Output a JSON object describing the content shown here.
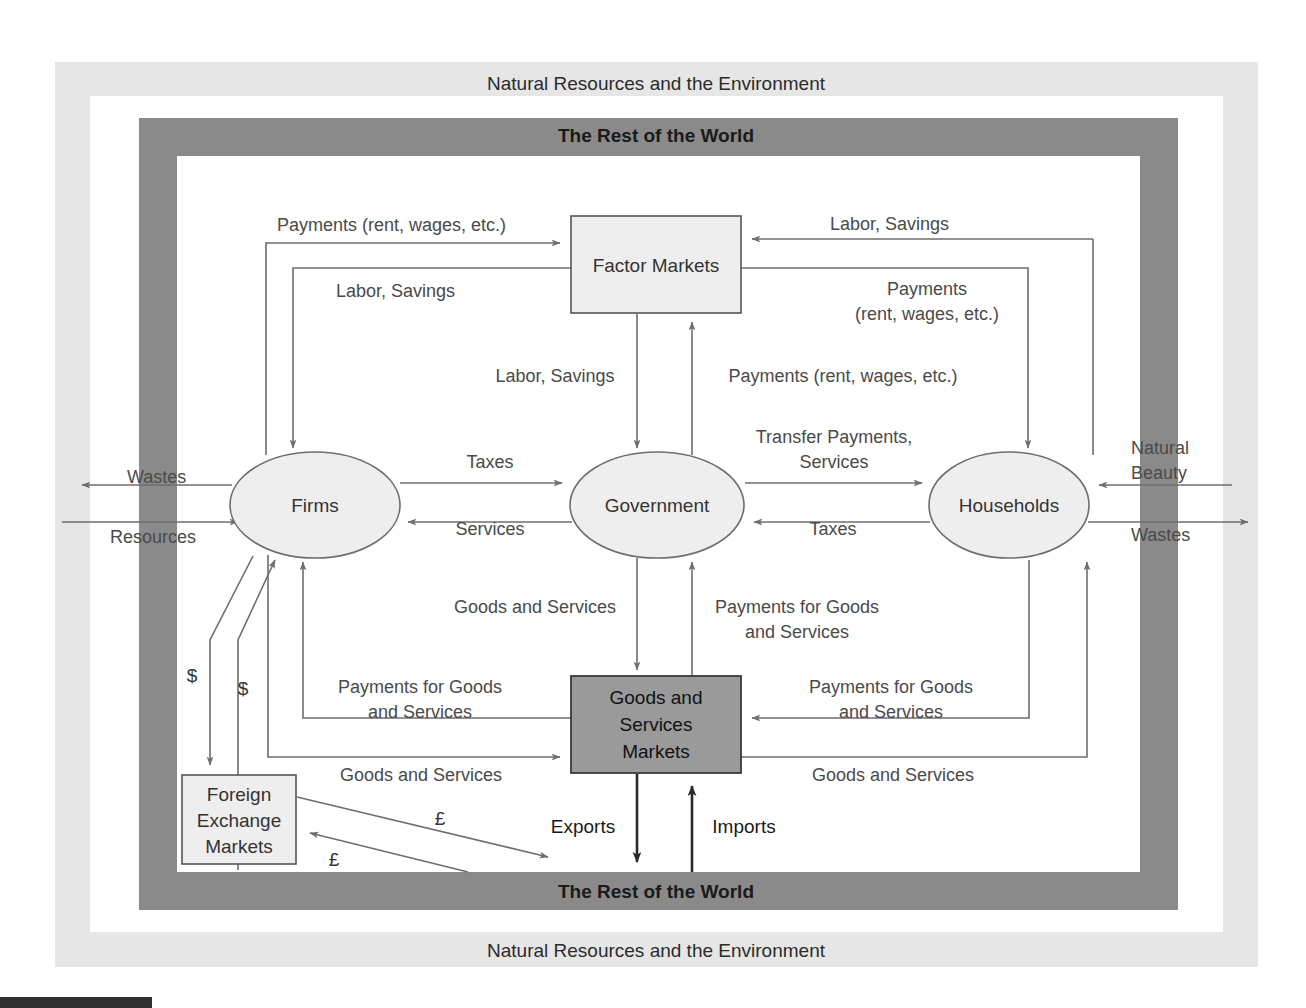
{
  "figure": {
    "type": "circular-flow-diagram",
    "bands": {
      "outer_top": "Natural Resources and the Environment",
      "outer_bottom": "Natural Resources and the Environment",
      "inner_top": "The Rest of the World",
      "inner_bottom": "The Rest of the World"
    },
    "colors": {
      "outer_band": "#e6e6e6",
      "inner_band": "#8a8a8a",
      "node_fill": "#eeeeee",
      "goods_box_fill": "#9a9a9a",
      "line": "#6e6e6e",
      "line_dark": "#2a2a2a",
      "text": "#333333"
    },
    "nodes": [
      {
        "id": "factor-markets",
        "label": "Factor Markets",
        "shape": "rect",
        "fill": "#eeeeee"
      },
      {
        "id": "firms",
        "label": "Firms",
        "shape": "ellipse",
        "fill": "#eeeeee"
      },
      {
        "id": "government",
        "label": "Government",
        "shape": "ellipse",
        "fill": "#eeeeee"
      },
      {
        "id": "households",
        "label": "Households",
        "shape": "ellipse",
        "fill": "#eeeeee"
      },
      {
        "id": "goods-services-markets",
        "label_line1": "Goods and",
        "label_line2": "Services",
        "label_line3": "Markets",
        "shape": "rect",
        "fill": "#9a9a9a"
      },
      {
        "id": "foreign-exchange-markets",
        "label_line1": "Foreign",
        "label_line2": "Exchange",
        "label_line3": "Markets",
        "shape": "rect",
        "fill": "#eeeeee"
      }
    ],
    "flows": {
      "payments_rent_wages_top_left": "Payments (rent, wages, etc.)",
      "labor_savings_left": "Labor, Savings",
      "labor_savings_right": "Labor, Savings",
      "payments_right_l1": "Payments",
      "payments_right_l2": "(rent, wages, etc.)",
      "labor_savings_center": "Labor, Savings",
      "payments_rent_wages_center": "Payments (rent, wages, etc.)",
      "transfer_payments_l1": "Transfer Payments,",
      "transfer_payments_l2": "Services",
      "taxes_firms_gov": "Taxes",
      "services_gov_firms": "Services",
      "taxes_hh_gov": "Taxes",
      "goods_and_services_center": "Goods and Services",
      "payments_goods_center_l1": "Payments for Goods",
      "payments_goods_center_l2": "and Services",
      "payments_goods_left_l1": "Payments for Goods",
      "payments_goods_left_l2": "and Services",
      "payments_goods_right_l1": "Payments for Goods",
      "payments_goods_right_l2": "and Services",
      "goods_and_services_left": "Goods and Services",
      "goods_and_services_right": "Goods and Services",
      "wastes_left": "Wastes",
      "resources_left": "Resources",
      "natural_beauty_l1": "Natural",
      "natural_beauty_l2": "Beauty",
      "wastes_right": "Wastes",
      "exports": "Exports",
      "imports": "Imports",
      "dollar_out": "$",
      "dollar_in": "$",
      "pound_out": "£",
      "pound_in": "£"
    }
  }
}
